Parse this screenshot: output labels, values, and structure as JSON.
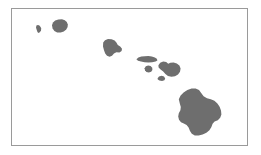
{
  "figure": {
    "background_color": "#ffffff",
    "width": 261,
    "height": 155
  },
  "frame": {
    "border_color": "#9a9a9a",
    "border_width": 1,
    "x": 11,
    "y": 8,
    "width": 237,
    "height": 138
  },
  "map": {
    "land_color": "#6e6e6e",
    "water_color": "#ffffff",
    "projection_orientation": "northwest-to-southeast chain",
    "islands": [
      {
        "name": "Niihau",
        "label": "",
        "centroid": [
          40,
          30
        ],
        "path": "M 36.4 25.6 L 38.0 25.0 L 39.4 25.6 L 40.6 27.0 L 41.2 28.6 L 41.0 30.4 L 40.0 32.0 L 38.8 33.0 L 37.8 32.6 L 37.2 31.2 L 36.6 29.4 L 36.0 27.6 Z"
      },
      {
        "name": "Kauai",
        "label": "",
        "centroid": [
          59,
          26
        ],
        "path": "M 52.0 25.2 L 53.0 22.6 L 55.2 20.6 L 58.4 19.4 L 62.0 19.2 L 64.8 20.2 L 66.8 22.0 L 67.8 24.4 L 67.6 27.0 L 66.2 29.6 L 63.8 31.6 L 60.6 32.6 L 57.2 32.4 L 54.4 31.0 L 52.6 28.6 Z"
      },
      {
        "name": "Oahu",
        "label": "",
        "centroid": [
          112,
          48
        ],
        "path": "M 103.2 42.6 L 105.0 40.2 L 108.0 39.0 L 111.6 39.2 L 114.6 40.6 L 116.4 42.6 L 117.8 45.0 L 120.2 46.6 L 122.0 48.8 L 121.6 51.0 L 119.4 52.4 L 116.4 52.2 L 114.0 53.6 L 112.0 55.8 L 109.6 56.8 L 107.0 55.8 L 105.2 53.4 L 104.0 50.2 L 103.0 46.6 Z"
      },
      {
        "name": "Molokai",
        "label": "",
        "centroid": [
          146,
          59
        ],
        "path": "M 136.4 59.2 L 138.4 57.6 L 141.4 56.6 L 144.8 56.2 L 148.4 56.0 L 151.8 56.4 L 154.8 57.4 L 156.8 58.8 L 157.4 60.4 L 155.6 61.6 L 152.2 62.2 L 148.4 62.4 L 144.6 62.2 L 141.0 61.6 L 138.0 60.8 Z"
      },
      {
        "name": "Lanai",
        "label": "",
        "centroid": [
          148,
          69
        ],
        "path": "M 144.6 68.2 L 145.8 66.2 L 148.2 65.4 L 150.6 66.0 L 152.2 67.8 L 152.4 70.0 L 151.2 71.8 L 148.8 72.6 L 146.4 72.0 L 145.0 70.2 Z"
      },
      {
        "name": "Maui",
        "label": "",
        "centroid": [
          169,
          69
        ],
        "path": "M 158.4 65.2 L 160.2 62.8 L 163.2 61.6 L 166.2 62.0 L 168.2 63.8 L 170.4 62.8 L 173.6 62.4 L 176.8 63.4 L 179.4 65.6 L 180.6 68.6 L 180.0 71.8 L 178.0 74.4 L 175.0 76.2 L 171.4 76.8 L 168.0 76.0 L 165.4 74.0 L 163.2 71.6 L 160.6 69.4 L 158.6 67.4 Z"
      },
      {
        "name": "Kahoolawe",
        "label": "",
        "centroid": [
          161,
          78
        ],
        "path": "M 157.6 78.2 L 159.0 76.4 L 161.6 75.8 L 164.0 76.6 L 165.2 78.4 L 164.4 80.2 L 162.0 81.0 L 159.4 80.4 L 157.8 79.4 Z"
      },
      {
        "name": "Hawaii",
        "label": "",
        "centroid": [
          199,
          112
        ],
        "path": "M 178.8 99.2 L 180.6 95.6 L 183.6 92.4 L 187.4 90.0 L 191.6 88.6 L 195.6 88.4 L 199.0 90.0 L 201.2 93.0 L 203.6 96.2 L 207.0 98.2 L 210.8 99.2 L 214.4 100.8 L 217.4 103.4 L 219.6 106.8 L 221.0 110.6 L 221.4 114.4 L 220.2 117.8 L 217.8 120.2 L 214.6 121.4 L 212.6 123.8 L 211.4 127.0 L 209.4 130.2 L 206.4 132.8 L 202.6 134.6 L 198.6 135.6 L 194.8 135.4 L 191.8 133.8 L 190.0 131.0 L 188.6 127.6 L 186.6 125.0 L 183.8 123.6 L 181.0 122.2 L 179.0 119.8 L 178.2 116.6 L 178.8 113.2 L 180.4 110.2 L 180.8 107.0 L 179.8 103.6 Z"
      }
    ]
  }
}
